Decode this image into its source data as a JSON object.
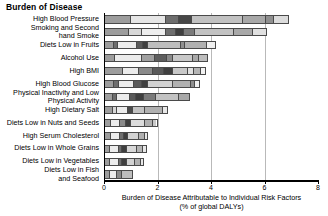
{
  "chart_data": {
    "type": "bar",
    "orientation": "horizontal",
    "stacked": true,
    "title": "Burden of Disease",
    "xlabel": "Burden of Disease Attributable to Individual Risk Factors\n(% of global DALYs)",
    "ylabel": "",
    "xlim": [
      0,
      8
    ],
    "ylim": [
      0,
      13
    ],
    "grid": true,
    "gridlines_x": [
      2,
      4,
      6
    ],
    "xticks": [
      0,
      2,
      4,
      6,
      8
    ],
    "xtick_labels": [
      "0",
      "2",
      "4",
      "6",
      "8"
    ],
    "legend": "none",
    "categories": [
      "High Blood Pressure",
      "Smoking and Second\nhand Smoke",
      "Diets Low in Fruits",
      "Alcohol Use",
      "High BMI",
      "High Blood Glucose",
      "Physical Inactivity and Low\nPhysical Activity",
      "High Dietary Salt",
      "Diets Low in Nuts and Seeds",
      "High Serum Cholesterol",
      "Diets Low in Whole Grains",
      "Diets Low in Vegetables",
      "Diets Low in Fish\nand Seafood"
    ],
    "values": [
      6.9,
      6.1,
      4.2,
      3.9,
      3.8,
      3.6,
      3.2,
      2.4,
      2.0,
      1.65,
      1.6,
      1.5,
      1.1
    ],
    "bars": [
      {
        "category": "High Blood Pressure",
        "total": 6.9,
        "segments": [
          {
            "value": 1.0,
            "shade": "#9d9d9d"
          },
          {
            "value": 1.3,
            "shade": "#e6e6e6"
          },
          {
            "value": 0.5,
            "shade": "#6e6e6e"
          },
          {
            "value": 0.5,
            "shade": "#474747"
          },
          {
            "value": 1.9,
            "shade": "#c2c2c2"
          },
          {
            "value": 0.9,
            "shade": "#a8a8a8"
          },
          {
            "value": 0.3,
            "shade": "#8f8f8f"
          },
          {
            "value": 0.5,
            "shade": "#dcdcdc"
          }
        ]
      },
      {
        "category": "Smoking and Second hand Smoke",
        "total": 6.1,
        "segments": [
          {
            "value": 0.9,
            "shade": "#9d9d9d"
          },
          {
            "value": 0.5,
            "shade": "#d8d8d8"
          },
          {
            "value": 0.9,
            "shade": "#eeeeee"
          },
          {
            "value": 0.4,
            "shade": "#6e6e6e"
          },
          {
            "value": 0.3,
            "shade": "#3f3f3f"
          },
          {
            "value": 0.4,
            "shade": "#7a7a7a"
          },
          {
            "value": 1.5,
            "shade": "#c2c2c2"
          },
          {
            "value": 0.7,
            "shade": "#a8a8a8"
          },
          {
            "value": 0.5,
            "shade": "#e0e0e0"
          }
        ]
      },
      {
        "category": "Diets Low in Fruits",
        "total": 4.2,
        "segments": [
          {
            "value": 0.35,
            "shade": "#9d9d9d"
          },
          {
            "value": 0.15,
            "shade": "#6e6e6e"
          },
          {
            "value": 0.7,
            "shade": "#ececec"
          },
          {
            "value": 0.25,
            "shade": "#5a5a5a"
          },
          {
            "value": 0.2,
            "shade": "#3f3f3f"
          },
          {
            "value": 1.25,
            "shade": "#bdbdbd"
          },
          {
            "value": 0.15,
            "shade": "#8f8f8f"
          },
          {
            "value": 0.85,
            "shade": "#b0b0b0"
          },
          {
            "value": 0.3,
            "shade": "#f0f0f0"
          }
        ]
      },
      {
        "category": "Alcohol Use",
        "total": 3.9,
        "segments": [
          {
            "value": 0.4,
            "shade": "#9d9d9d"
          },
          {
            "value": 1.0,
            "shade": "#ececec"
          },
          {
            "value": 0.5,
            "shade": "#a0a0a0"
          },
          {
            "value": 0.45,
            "shade": "#5e5e5e"
          },
          {
            "value": 0.25,
            "shade": "#8a8a8a"
          },
          {
            "value": 0.75,
            "shade": "#c8c8c8"
          },
          {
            "value": 0.25,
            "shade": "#a8a8a8"
          },
          {
            "value": 0.3,
            "shade": "#bdbdbd"
          }
        ]
      },
      {
        "category": "High BMI",
        "total": 3.8,
        "segments": [
          {
            "value": 0.7,
            "shade": "#9d9d9d"
          },
          {
            "value": 0.6,
            "shade": "#ececec"
          },
          {
            "value": 0.55,
            "shade": "#8a8a8a"
          },
          {
            "value": 0.4,
            "shade": "#5a5a5a"
          },
          {
            "value": 0.35,
            "shade": "#3f3f3f"
          },
          {
            "value": 0.55,
            "shade": "#c8c8c8"
          },
          {
            "value": 0.25,
            "shade": "#e0e0e0"
          },
          {
            "value": 0.25,
            "shade": "#b5b5b5"
          },
          {
            "value": 0.15,
            "shade": "#f2f2f2"
          }
        ]
      },
      {
        "category": "High Blood Glucose",
        "total": 3.6,
        "segments": [
          {
            "value": 0.35,
            "shade": "#9d9d9d"
          },
          {
            "value": 0.2,
            "shade": "#6e6e6e"
          },
          {
            "value": 0.55,
            "shade": "#ececec"
          },
          {
            "value": 0.3,
            "shade": "#5a5a5a"
          },
          {
            "value": 0.25,
            "shade": "#3f3f3f"
          },
          {
            "value": 0.95,
            "shade": "#d2d2d2"
          },
          {
            "value": 0.7,
            "shade": "#b0b0b0"
          },
          {
            "value": 0.15,
            "shade": "#8f8f8f"
          },
          {
            "value": 0.15,
            "shade": "#f0f0f0"
          }
        ]
      },
      {
        "category": "Physical Inactivity and Low Physical Activity",
        "total": 3.2,
        "segments": [
          {
            "value": 0.3,
            "shade": "#9d9d9d"
          },
          {
            "value": 0.15,
            "shade": "#6e6e6e"
          },
          {
            "value": 0.5,
            "shade": "#ececec"
          },
          {
            "value": 0.25,
            "shade": "#5a5a5a"
          },
          {
            "value": 0.3,
            "shade": "#3f3f3f"
          },
          {
            "value": 0.45,
            "shade": "#7a7a7a"
          },
          {
            "value": 0.9,
            "shade": "#c2c2c2"
          },
          {
            "value": 0.35,
            "shade": "#a8a8a8"
          }
        ]
      },
      {
        "category": "High Dietary Salt",
        "total": 2.4,
        "segments": [
          {
            "value": 0.3,
            "shade": "#9d9d9d"
          },
          {
            "value": 0.15,
            "shade": "#d8d8d8"
          },
          {
            "value": 0.45,
            "shade": "#ececec"
          },
          {
            "value": 0.2,
            "shade": "#4a4a4a"
          },
          {
            "value": 0.45,
            "shade": "#c2c2c2"
          },
          {
            "value": 0.7,
            "shade": "#b0b0b0"
          },
          {
            "value": 0.15,
            "shade": "#e8e8e8"
          }
        ]
      },
      {
        "category": "Diets Low in Nuts and Seeds",
        "total": 2.0,
        "segments": [
          {
            "value": 0.25,
            "shade": "#9d9d9d"
          },
          {
            "value": 0.35,
            "shade": "#ececec"
          },
          {
            "value": 0.2,
            "shade": "#8a8a8a"
          },
          {
            "value": 0.2,
            "shade": "#3f3f3f"
          },
          {
            "value": 0.55,
            "shade": "#dcdcdc"
          },
          {
            "value": 0.3,
            "shade": "#b0b0b0"
          },
          {
            "value": 0.15,
            "shade": "#c8c8c8"
          }
        ]
      },
      {
        "category": "High Serum Cholesterol",
        "total": 1.65,
        "segments": [
          {
            "value": 0.25,
            "shade": "#9d9d9d"
          },
          {
            "value": 0.35,
            "shade": "#ececec"
          },
          {
            "value": 0.15,
            "shade": "#6e6e6e"
          },
          {
            "value": 0.15,
            "shade": "#3f3f3f"
          },
          {
            "value": 0.45,
            "shade": "#d2d2d2"
          },
          {
            "value": 0.2,
            "shade": "#b0b0b0"
          },
          {
            "value": 0.1,
            "shade": "#e8e8e8"
          }
        ]
      },
      {
        "category": "Diets Low in Whole Grains",
        "total": 1.6,
        "segments": [
          {
            "value": 0.2,
            "shade": "#9d9d9d"
          },
          {
            "value": 0.35,
            "shade": "#ececec"
          },
          {
            "value": 0.12,
            "shade": "#6e6e6e"
          },
          {
            "value": 0.18,
            "shade": "#3f3f3f"
          },
          {
            "value": 0.4,
            "shade": "#d8d8d8"
          },
          {
            "value": 0.25,
            "shade": "#b5b5b5"
          },
          {
            "value": 0.1,
            "shade": "#e8e8e8"
          }
        ]
      },
      {
        "category": "Diets Low in Vegetables",
        "total": 1.5,
        "segments": [
          {
            "value": 0.2,
            "shade": "#9d9d9d"
          },
          {
            "value": 0.35,
            "shade": "#ececec"
          },
          {
            "value": 0.12,
            "shade": "#6e6e6e"
          },
          {
            "value": 0.18,
            "shade": "#3f3f3f"
          },
          {
            "value": 0.35,
            "shade": "#d2d2d2"
          },
          {
            "value": 0.2,
            "shade": "#b0b0b0"
          },
          {
            "value": 0.1,
            "shade": "#e8e8e8"
          }
        ]
      },
      {
        "category": "Diets Low in Fish and Seafood",
        "total": 1.1,
        "segments": [
          {
            "value": 0.2,
            "shade": "#9d9d9d"
          },
          {
            "value": 0.3,
            "shade": "#ececec"
          },
          {
            "value": 0.2,
            "shade": "#8a8a8a"
          },
          {
            "value": 0.4,
            "shade": "#bdbdbd"
          }
        ]
      }
    ]
  },
  "colors": {
    "axis": "#000000",
    "gridline": "#b9b9b9",
    "bar_outline": "#4a4a4a",
    "background": "#ffffff",
    "text": "#000000"
  }
}
